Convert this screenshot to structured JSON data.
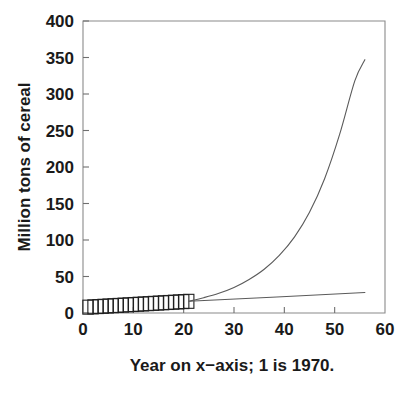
{
  "chart_data": {
    "type": "line",
    "title": "",
    "xlabel": "Year on x−axis; 1 is 1970.",
    "ylabel": "Million tons of cereal",
    "xlim": [
      0,
      60
    ],
    "ylim": [
      0,
      400
    ],
    "xticks": [
      0,
      10,
      20,
      30,
      40,
      50,
      60
    ],
    "yticks": [
      0,
      50,
      100,
      150,
      200,
      250,
      300,
      350,
      400
    ],
    "xtick_labels": [
      "0",
      "10",
      "20",
      "30",
      "40",
      "50",
      "60"
    ],
    "ytick_labels": [
      "0",
      "50",
      "100",
      "150",
      "200",
      "250",
      "300",
      "350",
      "400"
    ],
    "grid": false,
    "legend": "none",
    "series": [
      {
        "name": "observed-data-markers",
        "marker": "open-square",
        "style": "markers",
        "x": [
          1,
          2,
          3,
          4,
          5,
          6,
          7,
          8,
          9,
          10,
          11,
          12,
          13,
          14,
          15,
          16,
          17,
          18,
          19,
          20,
          21
        ],
        "values": [
          8.0,
          8.4,
          8.8,
          9.2,
          9.6,
          10.0,
          10.4,
          10.8,
          11.2,
          11.6,
          12.0,
          12.4,
          12.8,
          13.2,
          13.6,
          14.0,
          14.4,
          14.8,
          15.2,
          15.6,
          16.0
        ]
      },
      {
        "name": "exponential-projection",
        "marker": "none",
        "style": "line",
        "x": [
          21,
          24,
          27,
          30,
          33,
          36,
          39,
          42,
          45,
          48,
          51,
          54,
          56
        ],
        "values": [
          16,
          21,
          27,
          35,
          46,
          60,
          79,
          104,
          138,
          184,
          245,
          318,
          347
        ]
      },
      {
        "name": "linear-projection",
        "marker": "none",
        "style": "line",
        "x": [
          21,
          56
        ],
        "values": [
          16,
          28
        ]
      }
    ]
  },
  "axes": {
    "y_axis_title": "Million tons of cereal",
    "x_axis_caption": "Year on x−axis; 1 is 1970."
  },
  "colors": {
    "background": "#ffffff",
    "frame": "#8a8a8a",
    "curve": "#5a5a5a",
    "marker": "#1f1f1f",
    "text": "#1a1a1a"
  }
}
